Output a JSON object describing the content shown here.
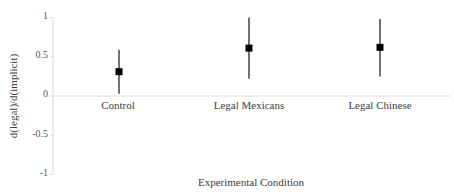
{
  "chart_data": {
    "type": "scatter",
    "subtype": "point-with-error-bars",
    "title": "",
    "xlabel": "Experimental Condition",
    "ylabel": "d(legal)/d(implicit)",
    "categories": [
      "Control",
      "Legal Mexicans",
      "Legal Chinese"
    ],
    "series": [
      {
        "name": "d(legal)/d(implicit)",
        "values": [
          0.31,
          0.61,
          0.62
        ],
        "error_lower": [
          0.03,
          0.22,
          0.25
        ],
        "error_upper": [
          0.59,
          1.0,
          0.98
        ]
      }
    ],
    "ylim": [
      -1,
      1
    ],
    "yticks": [
      1,
      0.5,
      0,
      -0.5,
      -1
    ],
    "ytick_labels": [
      "1",
      "0.5",
      "0",
      "-0.5",
      "-1"
    ],
    "grid": false,
    "legend": "none",
    "marker": "square",
    "marker_color": "#000000",
    "axis_color": "#d9d9d9"
  },
  "axes": {
    "ylabel": "d(legal)/d(implicit)",
    "xlabel": "Experimental Condition",
    "ytick_labels": [
      "1",
      "0.5",
      "0",
      "-0.5",
      "-1"
    ],
    "xtick_labels": [
      "Control",
      "Legal Mexicans",
      "Legal Chinese"
    ]
  }
}
